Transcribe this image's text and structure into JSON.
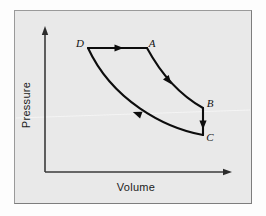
{
  "figure": {
    "kind": "pv-diagram",
    "background_color": "#e9e9e9",
    "frame_color": "#9a9a9a",
    "ink_color": "#0d0d0d"
  },
  "axes": {
    "x_label": "Volume",
    "y_label": "Pressure",
    "x_axis_name": "volume-axis",
    "y_axis_name": "pressure-axis",
    "origin": {
      "x": 45,
      "y": 172
    },
    "x_end": {
      "x": 226,
      "y": 172
    },
    "y_end": {
      "x": 45,
      "y": 32
    },
    "has_arrowheads": true,
    "has_tick_labels": false,
    "has_gridlines": false
  },
  "cycle": {
    "name": "thermodynamic-cycle",
    "direction": "clockwise",
    "vertices": [
      {
        "label": "D",
        "x": 88,
        "y": 48,
        "label_x": 80,
        "label_y": 47
      },
      {
        "label": "A",
        "x": 147,
        "y": 48,
        "label_x": 152,
        "label_y": 47
      },
      {
        "label": "B",
        "x": 203,
        "y": 108,
        "label_x": 210,
        "label_y": 107
      },
      {
        "label": "C",
        "x": 203,
        "y": 135,
        "label_x": 210,
        "label_y": 141
      }
    ],
    "segments": [
      {
        "name": "segment-d-to-a",
        "from": "D",
        "to": "A",
        "shape": "straight",
        "path": "M 88 48 L 147 48",
        "arrow_at": {
          "x": 118,
          "y": 48,
          "angle": 0
        }
      },
      {
        "name": "segment-a-to-b",
        "from": "A",
        "to": "B",
        "shape": "curve",
        "path": "M 147 48 C 160 72, 178 94, 203 108",
        "arrow_at": {
          "x": 168,
          "y": 80,
          "angle": 52
        }
      },
      {
        "name": "segment-b-to-c",
        "from": "B",
        "to": "C",
        "shape": "straight",
        "path": "M 203 108 L 203 135",
        "arrow_at": {
          "x": 203,
          "y": 124,
          "angle": 90
        }
      },
      {
        "name": "segment-c-to-d",
        "from": "C",
        "to": "D",
        "shape": "curve",
        "path": "M 203 135 C 164 128, 112 100, 88 48",
        "arrow_at": {
          "x": 138,
          "y": 114,
          "angle": 200
        }
      }
    ]
  }
}
